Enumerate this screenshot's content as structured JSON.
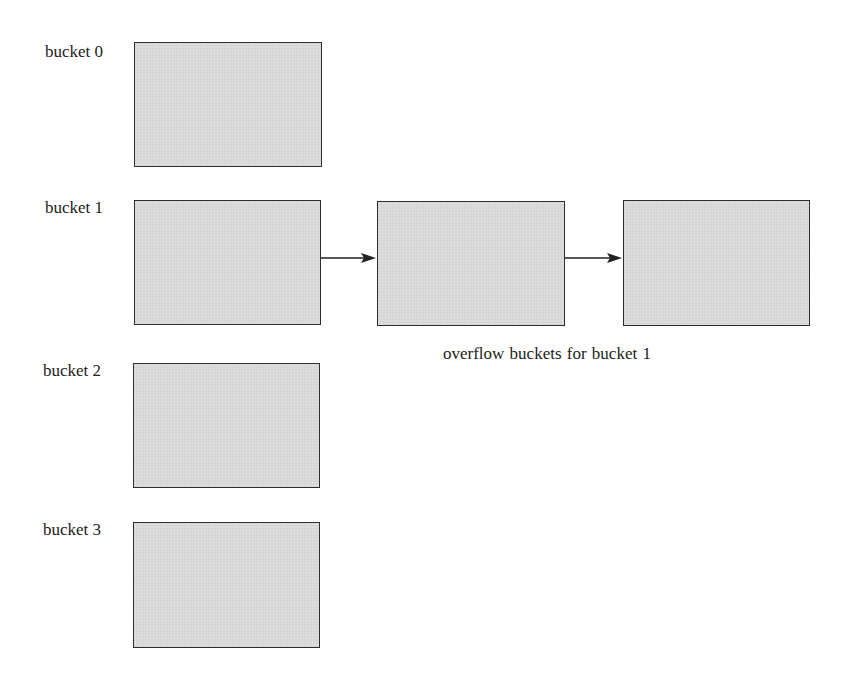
{
  "diagram": {
    "type": "hash-bucket-overflow-chaining",
    "buckets": [
      {
        "label": "bucket 0",
        "x": 134,
        "y": 42,
        "w": 188,
        "h": 125
      },
      {
        "label": "bucket 1",
        "x": 134,
        "y": 200,
        "w": 187,
        "h": 125
      },
      {
        "label": "bucket 2",
        "x": 133,
        "y": 363,
        "w": 187,
        "h": 125
      },
      {
        "label": "bucket 3",
        "x": 133,
        "y": 522,
        "w": 187,
        "h": 126
      }
    ],
    "overflow_buckets": [
      {
        "x": 377,
        "y": 201,
        "w": 188,
        "h": 125
      },
      {
        "x": 623,
        "y": 200,
        "w": 187,
        "h": 126
      }
    ],
    "arrows": [
      {
        "from": "bucket 1",
        "to": "overflow 1",
        "x1": 321,
        "x2": 376,
        "y": 258
      },
      {
        "from": "overflow 1",
        "to": "overflow 2",
        "x1": 565,
        "x2": 622,
        "y": 258
      }
    ],
    "caption": "overflow  buckets for bucket 1",
    "colors": {
      "box_fill": "#d9d9d9",
      "box_border": "#2e2e2e",
      "arrow": "#222222"
    }
  }
}
